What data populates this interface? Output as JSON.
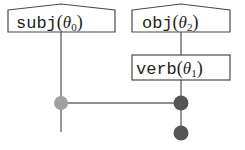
{
  "diagram": {
    "type": "tree-structure",
    "nodes": [
      {
        "id": "subj",
        "func": "subj",
        "param": "θ",
        "subscript": "0",
        "shape": "peaked-box"
      },
      {
        "id": "obj",
        "func": "obj",
        "param": "θ",
        "subscript": "2",
        "shape": "peaked-box"
      },
      {
        "id": "verb",
        "func": "verb",
        "param": "θ",
        "subscript": "1",
        "shape": "box"
      }
    ],
    "junctions": [
      {
        "id": "j-left",
        "color": "#a0a0a0",
        "tone": "light"
      },
      {
        "id": "j-right-upper",
        "color": "#555555",
        "tone": "dark"
      },
      {
        "id": "j-right-lower",
        "color": "#555555",
        "tone": "dark"
      }
    ],
    "edges": [
      {
        "from": "obj",
        "to": "verb"
      },
      {
        "from": "subj",
        "to": "j-left"
      },
      {
        "from": "verb",
        "to": "j-right-upper"
      },
      {
        "from": "j-left",
        "to": "j-right-upper"
      },
      {
        "from": "j-right-upper",
        "to": "j-right-lower"
      }
    ],
    "colors": {
      "stroke": "#4a4a4a",
      "edge": "#6a6a6a",
      "text": "#222222",
      "light_node": "#a0a0a0",
      "dark_node": "#555555"
    }
  }
}
